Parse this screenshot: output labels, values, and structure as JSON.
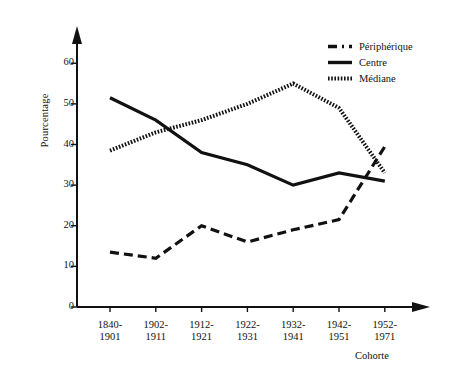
{
  "chart_data": {
    "type": "line",
    "title": "",
    "xlabel": "Cohorte",
    "ylabel": "Pourcentage",
    "categories": [
      "1840-\n1901",
      "1902-\n1911",
      "1912-\n1921",
      "1922-\n1931",
      "1932-\n1941",
      "1942-\n1951",
      "1952-\n1971"
    ],
    "category_lines": [
      [
        "1840-",
        "1901"
      ],
      [
        "1902-",
        "1911"
      ],
      [
        "1912-",
        "1921"
      ],
      [
        "1922-",
        "1931"
      ],
      [
        "1932-",
        "1941"
      ],
      [
        "1942-",
        "1951"
      ],
      [
        "1952-",
        "1971"
      ]
    ],
    "yticks": [
      0,
      10,
      20,
      30,
      40,
      50,
      60
    ],
    "ylim": [
      0,
      64
    ],
    "grid": false,
    "legend_position": "top-right",
    "series": [
      {
        "name": "Périphérique",
        "style": "dash-dot",
        "color": "#111111",
        "values": [
          13.5,
          12.0,
          20.0,
          16.0,
          19.0,
          21.5,
          39.5
        ]
      },
      {
        "name": "Centre",
        "style": "solid",
        "color": "#111111",
        "values": [
          51.5,
          46.0,
          38.0,
          35.0,
          30.0,
          33.0,
          31.0
        ]
      },
      {
        "name": "Médiane",
        "style": "dotted",
        "color": "#111111",
        "values": [
          38.5,
          43.0,
          46.0,
          50.0,
          55.0,
          49.0,
          33.0
        ]
      }
    ]
  },
  "axes": {
    "y_axis_name": "y-axis",
    "x_axis_name": "x-axis"
  }
}
